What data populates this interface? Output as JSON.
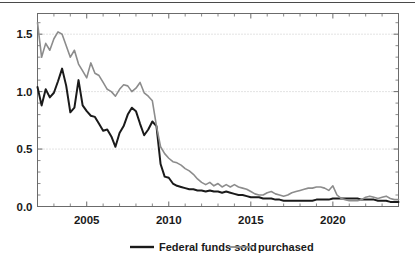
{
  "chart_data": {
    "type": "line",
    "title": "",
    "subtitle": "",
    "xlabel": "",
    "ylabel": "",
    "xlim": [
      2002.0,
      2024.0
    ],
    "ylim": [
      0.0,
      1.68
    ],
    "grid": true,
    "grid_axis": "y",
    "grid_style": "dotted",
    "legend_position": "bottom-center",
    "y_ticks": [
      0.0,
      0.5,
      1.0,
      1.5
    ],
    "y_tick_labels": [
      "0.0",
      "0.5",
      "1.0",
      "1.5"
    ],
    "x_ticks": [
      2005,
      2010,
      2015,
      2020
    ],
    "x_tick_labels": [
      "2005",
      "2010",
      "2015",
      "2020"
    ],
    "x_minor_tick_step": 1,
    "y_minor_tick_step": 0.1,
    "series": [
      {
        "name": "Federal funds sold",
        "color": "#1a1a1a",
        "width": 2.0,
        "x": [
          2002.0,
          2002.25,
          2002.5,
          2002.75,
          2003.0,
          2003.25,
          2003.5,
          2003.75,
          2004.0,
          2004.25,
          2004.5,
          2004.75,
          2005.0,
          2005.25,
          2005.5,
          2005.75,
          2006.0,
          2006.25,
          2006.5,
          2006.75,
          2007.0,
          2007.25,
          2007.5,
          2007.75,
          2008.0,
          2008.25,
          2008.5,
          2008.75,
          2009.0,
          2009.25,
          2009.5,
          2009.75,
          2010.0,
          2010.25,
          2010.5,
          2010.75,
          2011.0,
          2011.25,
          2011.5,
          2011.75,
          2012.0,
          2012.25,
          2012.5,
          2012.75,
          2013.0,
          2013.25,
          2013.5,
          2013.75,
          2014.0,
          2014.25,
          2014.5,
          2014.75,
          2015.0,
          2015.25,
          2015.5,
          2015.75,
          2016.0,
          2016.25,
          2016.5,
          2016.75,
          2017.0,
          2017.25,
          2017.5,
          2017.75,
          2018.0,
          2018.25,
          2018.5,
          2018.75,
          2019.0,
          2019.25,
          2019.5,
          2019.75,
          2020.0,
          2020.25,
          2020.5,
          2020.75,
          2021.0,
          2021.25,
          2021.5,
          2021.75,
          2022.0,
          2022.25,
          2022.5,
          2022.75,
          2023.0,
          2023.25,
          2023.5,
          2023.75,
          2024.0
        ],
        "values": [
          1.04,
          0.88,
          1.02,
          0.95,
          0.99,
          1.09,
          1.2,
          1.05,
          0.82,
          0.86,
          1.1,
          0.88,
          0.83,
          0.79,
          0.78,
          0.72,
          0.66,
          0.67,
          0.61,
          0.52,
          0.64,
          0.7,
          0.8,
          0.86,
          0.83,
          0.72,
          0.62,
          0.67,
          0.74,
          0.7,
          0.37,
          0.26,
          0.25,
          0.2,
          0.18,
          0.17,
          0.16,
          0.15,
          0.15,
          0.14,
          0.14,
          0.13,
          0.14,
          0.13,
          0.13,
          0.12,
          0.13,
          0.12,
          0.11,
          0.1,
          0.1,
          0.09,
          0.08,
          0.08,
          0.08,
          0.07,
          0.07,
          0.07,
          0.06,
          0.06,
          0.05,
          0.05,
          0.05,
          0.05,
          0.05,
          0.05,
          0.05,
          0.05,
          0.06,
          0.06,
          0.06,
          0.06,
          0.07,
          0.07,
          0.07,
          0.07,
          0.07,
          0.07,
          0.07,
          0.06,
          0.06,
          0.06,
          0.06,
          0.05,
          0.05,
          0.05,
          0.04,
          0.04,
          0.04
        ]
      },
      {
        "name": "purchased",
        "color": "#8c8c8c",
        "width": 1.6,
        "x": [
          2002.0,
          2002.25,
          2002.5,
          2002.75,
          2003.0,
          2003.25,
          2003.5,
          2003.75,
          2004.0,
          2004.25,
          2004.5,
          2004.75,
          2005.0,
          2005.25,
          2005.5,
          2005.75,
          2006.0,
          2006.25,
          2006.5,
          2006.75,
          2007.0,
          2007.25,
          2007.5,
          2007.75,
          2008.0,
          2008.25,
          2008.5,
          2008.75,
          2009.0,
          2009.25,
          2009.5,
          2009.75,
          2010.0,
          2010.25,
          2010.5,
          2010.75,
          2011.0,
          2011.25,
          2011.5,
          2011.75,
          2012.0,
          2012.25,
          2012.5,
          2012.75,
          2013.0,
          2013.25,
          2013.5,
          2013.75,
          2014.0,
          2014.25,
          2014.5,
          2014.75,
          2015.0,
          2015.25,
          2015.5,
          2015.75,
          2016.0,
          2016.25,
          2016.5,
          2016.75,
          2017.0,
          2017.25,
          2017.5,
          2017.75,
          2018.0,
          2018.25,
          2018.5,
          2018.75,
          2019.0,
          2019.25,
          2019.5,
          2019.75,
          2020.0,
          2020.25,
          2020.5,
          2020.75,
          2021.0,
          2021.25,
          2021.5,
          2021.75,
          2022.0,
          2022.25,
          2022.5,
          2022.75,
          2023.0,
          2023.25,
          2023.5,
          2023.75,
          2024.0
        ],
        "values": [
          1.6,
          1.3,
          1.42,
          1.36,
          1.46,
          1.52,
          1.5,
          1.4,
          1.3,
          1.36,
          1.24,
          1.18,
          1.12,
          1.25,
          1.16,
          1.14,
          1.08,
          1.02,
          1.0,
          0.96,
          1.02,
          1.06,
          1.05,
          1.0,
          1.03,
          1.08,
          0.99,
          0.96,
          0.92,
          0.7,
          0.52,
          0.46,
          0.42,
          0.39,
          0.38,
          0.36,
          0.33,
          0.31,
          0.28,
          0.24,
          0.21,
          0.19,
          0.21,
          0.18,
          0.2,
          0.17,
          0.19,
          0.17,
          0.19,
          0.17,
          0.16,
          0.15,
          0.13,
          0.11,
          0.1,
          0.1,
          0.12,
          0.13,
          0.11,
          0.1,
          0.09,
          0.1,
          0.12,
          0.13,
          0.14,
          0.15,
          0.16,
          0.16,
          0.17,
          0.17,
          0.16,
          0.14,
          0.18,
          0.1,
          0.07,
          0.06,
          0.05,
          0.05,
          0.05,
          0.06,
          0.08,
          0.09,
          0.08,
          0.07,
          0.08,
          0.09,
          0.07,
          0.06,
          0.06
        ]
      }
    ],
    "legend": [
      {
        "label": "Federal funds sold",
        "color": "#1a1a1a"
      },
      {
        "label": "purchased",
        "color": "#8c8c8c"
      }
    ]
  },
  "axes": {
    "y_labels": [
      "1.5",
      "1.0",
      "0.5",
      "0.0"
    ],
    "x_labels": [
      "2005",
      "2010",
      "2015",
      "2020"
    ]
  },
  "legend": {
    "item1_label": "Federal funds sold",
    "item2_label": "purchased"
  }
}
